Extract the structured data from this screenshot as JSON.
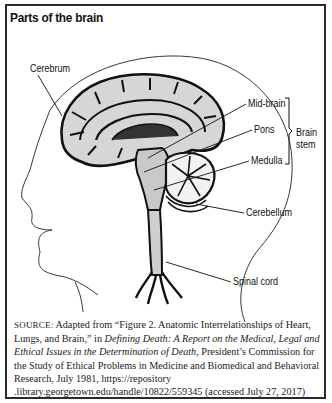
{
  "figure": {
    "title": "Parts of the brain",
    "labels": {
      "cerebrum": "Cerebrum",
      "midbrain": "Mid-brain",
      "pons": "Pons",
      "medulla": "Medulla",
      "brainstem_line1": "Brain",
      "brainstem_line2": "stem",
      "cerebellum": "Cerebellum",
      "spinal_cord": "Spinal cord"
    },
    "colors": {
      "border": "#2a2a2a",
      "ink": "#111111",
      "brain_fill": "#d4d4d4",
      "brain_shade": "#bdbdbd"
    }
  },
  "source": {
    "prefix": "SOURCE:",
    "part1": " Adapted from “Figure 2. Anatomic Interrelationships of Heart, Lungs, and Brain,” in ",
    "italic_title": "Defining Death: A Report on the Medical, Legal and Ethical Issues in the Determination of Death",
    "part2": ", President’s Commission for the Study of Ethical Problems in Medicine and Biomedical and Behavioral Research, July 1981, https://repository .library.georgetown.edu/handle/10822/559345 (accessed July 27, 2017)"
  }
}
